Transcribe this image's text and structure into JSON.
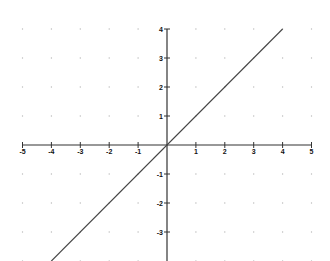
{
  "chart_data": {
    "type": "line",
    "title": "",
    "xlabel": "",
    "ylabel": "",
    "xlim": [
      -5,
      5
    ],
    "ylim": [
      -4,
      4
    ],
    "grid": "dots",
    "legend": null,
    "x_ticks": [
      -5,
      -4,
      -3,
      -2,
      -1,
      1,
      2,
      3,
      4,
      5
    ],
    "y_ticks": [
      4,
      3,
      2,
      1,
      -1,
      -2,
      -3
    ],
    "series": [
      {
        "name": "y = x",
        "x": [
          -4,
          4
        ],
        "y": [
          -4,
          4
        ],
        "color": "#444444"
      }
    ]
  },
  "style": {
    "axis_color": "#333333",
    "grid_color": "#bbbbbb",
    "line_color": "#444444"
  }
}
